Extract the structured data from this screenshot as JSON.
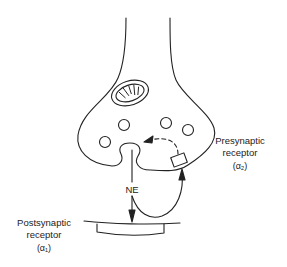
{
  "diagram": {
    "labels": {
      "ne": "NE",
      "presynaptic_line1": "Presynaptic",
      "presynaptic_line2": "receptor",
      "presynaptic_line3": "(α₂)",
      "postsynaptic_line1": "Postsynaptic",
      "postsynaptic_line2": "receptor",
      "postsynaptic_line3": "(α₁)"
    },
    "colors": {
      "stroke": "#222222",
      "background": "#ffffff"
    }
  }
}
